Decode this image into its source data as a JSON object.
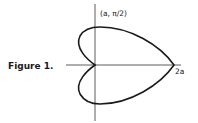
{
  "figure": {
    "caption": "Figure 1.",
    "point_label": "(a, π/2)",
    "axis_label": "2a",
    "curve": "cardioid r = a(1 + cos θ)",
    "colors": {
      "ink": "#1a1a1a",
      "background": "#ffffff"
    }
  }
}
